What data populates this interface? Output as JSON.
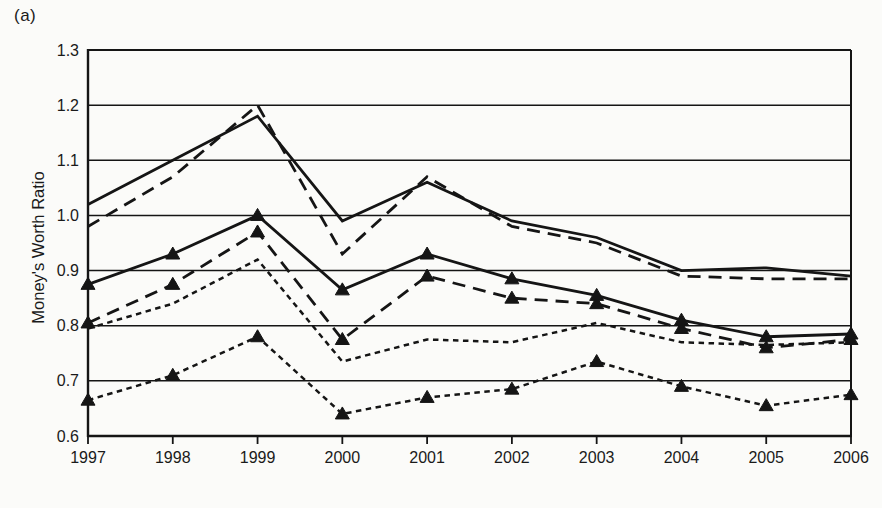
{
  "figure": {
    "background_color": "#fbfbf9",
    "ink_color": "#151515"
  },
  "chart_data": {
    "type": "line",
    "panel_label": "(a)",
    "title": "",
    "xlabel": "",
    "ylabel": "Money's Worth Ratio",
    "x": [
      "1997",
      "1998",
      "1999",
      "2000",
      "2001",
      "2002",
      "2003",
      "2004",
      "2005",
      "2006"
    ],
    "ylim": [
      0.6,
      1.3
    ],
    "ytick_step": 0.1,
    "ytick_labels": [
      "1.3",
      "1.2",
      "1.1",
      "1.0",
      "0.9",
      "0.8",
      "0.7",
      "0.6"
    ],
    "grid": "horizontal",
    "legend": "none",
    "series": [
      {
        "name": "short-dash",
        "line_style": "short-dash",
        "marker": "none",
        "values": [
          0.795,
          0.84,
          0.92,
          0.735,
          0.775,
          0.77,
          0.805,
          0.77,
          0.765,
          0.77
        ]
      },
      {
        "name": "long-dash",
        "line_style": "long-dash",
        "marker": "none",
        "values": [
          0.98,
          1.07,
          1.2,
          0.93,
          1.07,
          0.98,
          0.95,
          0.89,
          0.885,
          0.885
        ]
      },
      {
        "name": "solid",
        "line_style": "solid",
        "marker": "none",
        "values": [
          1.02,
          1.1,
          1.18,
          0.99,
          1.06,
          0.99,
          0.96,
          0.9,
          0.905,
          0.89
        ]
      },
      {
        "name": "long-dash-triangle",
        "line_style": "long-dash",
        "marker": "triangle",
        "values": [
          0.805,
          0.875,
          0.97,
          0.775,
          0.89,
          0.85,
          0.84,
          0.795,
          0.76,
          0.775
        ]
      },
      {
        "name": "solid-triangle",
        "line_style": "solid",
        "marker": "triangle",
        "values": [
          0.875,
          0.93,
          1.0,
          0.865,
          0.93,
          0.885,
          0.855,
          0.81,
          0.78,
          0.785
        ]
      },
      {
        "name": "short-dash-triangle",
        "line_style": "short-dash",
        "marker": "triangle",
        "values": [
          0.665,
          0.71,
          0.78,
          0.64,
          0.67,
          0.685,
          0.735,
          0.69,
          0.655,
          0.675
        ]
      }
    ]
  }
}
